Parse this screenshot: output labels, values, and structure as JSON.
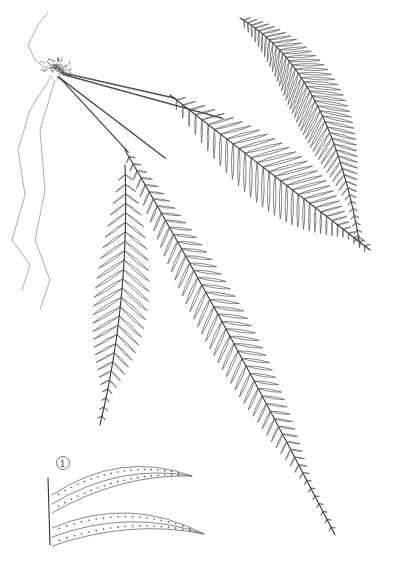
{
  "illustration": {
    "subject": "fern",
    "background": "#ffffff",
    "line_color": "#555555",
    "detail_label": "1"
  },
  "fronds": [
    {
      "name": "upper-right-frond",
      "start": [
        240,
        18
      ],
      "ctrl": [
        330,
        70
      ],
      "end": [
        360,
        245
      ],
      "pinna_len": 34,
      "count": 46,
      "side_bias": 1
    },
    {
      "name": "middle-frond",
      "start": [
        170,
        95
      ],
      "ctrl": [
        280,
        180
      ],
      "end": [
        370,
        250
      ],
      "pinna_len": 40,
      "count": 34,
      "side_bias": 1
    },
    {
      "name": "long-lower-frond",
      "start": [
        125,
        150
      ],
      "ctrl": [
        230,
        330
      ],
      "end": [
        335,
        535
      ],
      "pinna_len": 30,
      "count": 52,
      "side_bias": 1
    },
    {
      "name": "left-frond",
      "start": [
        125,
        165
      ],
      "ctrl": [
        130,
        300
      ],
      "end": [
        100,
        425
      ],
      "pinna_len": 34,
      "count": 28,
      "side_bias": 1
    }
  ],
  "stipes": [
    {
      "from": [
        60,
        72
      ],
      "to": [
        175,
        98
      ]
    },
    {
      "from": [
        62,
        74
      ],
      "to": [
        222,
        118
      ]
    },
    {
      "from": [
        58,
        76
      ],
      "to": [
        128,
        152
      ]
    },
    {
      "from": [
        60,
        78
      ],
      "to": [
        165,
        158
      ]
    }
  ],
  "rhizome": {
    "center": [
      58,
      68
    ],
    "radius": 16
  },
  "roots": [
    [
      [
        50,
        78
      ],
      [
        30,
        110
      ],
      [
        18,
        150
      ],
      [
        25,
        195
      ],
      [
        12,
        240
      ],
      [
        30,
        265
      ],
      [
        22,
        290
      ]
    ],
    [
      [
        55,
        80
      ],
      [
        40,
        130
      ],
      [
        45,
        190
      ],
      [
        35,
        240
      ],
      [
        50,
        280
      ],
      [
        40,
        310
      ]
    ],
    [
      [
        48,
        70
      ],
      [
        35,
        60
      ],
      [
        28,
        45
      ],
      [
        38,
        25
      ],
      [
        48,
        12
      ]
    ]
  ],
  "detail": {
    "label_pos": [
      63,
      463
    ],
    "pinnae": [
      {
        "start": [
          52,
          495
        ],
        "ctrl": [
          120,
          460
        ],
        "end": [
          192,
          476
        ]
      },
      {
        "start": [
          52,
          528
        ],
        "ctrl": [
          130,
          505
        ],
        "end": [
          204,
          534
        ]
      }
    ]
  }
}
